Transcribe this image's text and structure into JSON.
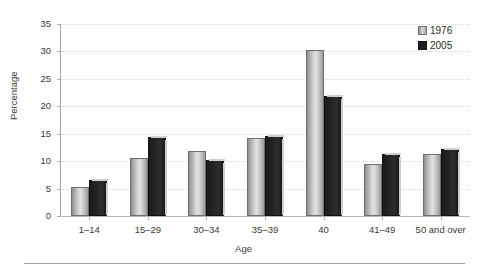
{
  "chart_data": {
    "type": "bar",
    "title": "",
    "xlabel": "Age",
    "ylabel": "Percentage",
    "categories": [
      "1–14",
      "15–29",
      "30–34",
      "35–39",
      "40",
      "41–49",
      "50 and over"
    ],
    "series": [
      {
        "name": "1976",
        "color": "#d6d6d6",
        "values": [
          5.3,
          10.5,
          11.8,
          14.3,
          30.3,
          9.5,
          11.3
        ]
      },
      {
        "name": "2005",
        "color": "#1e1e1e",
        "values": [
          6.6,
          14.4,
          10.3,
          14.5,
          21.8,
          11.3,
          12.3
        ]
      }
    ],
    "ylim": [
      0,
      35
    ],
    "yticks": [
      0,
      5,
      10,
      15,
      20,
      25,
      30,
      35
    ],
    "ytick_labels": [
      "0",
      "5",
      "10",
      "15",
      "20",
      "25",
      "30",
      "35"
    ],
    "grid": true,
    "grid_style": "dotted-horizontal",
    "legend_position": "top-right"
  },
  "legend": {
    "entries": [
      {
        "label": "1976"
      },
      {
        "label": "2005"
      }
    ]
  },
  "axes": {
    "y_title": "Percentage",
    "x_title": "Age"
  }
}
